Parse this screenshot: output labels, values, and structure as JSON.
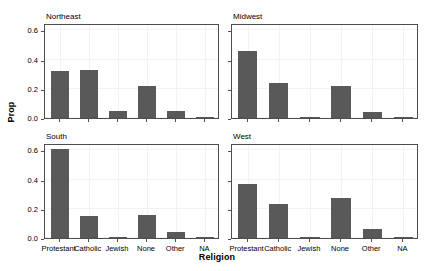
{
  "chart_data": {
    "type": "bar",
    "title": "",
    "xlabel": "Religion",
    "ylabel": "Prop",
    "ylim": [
      0,
      0.65
    ],
    "yticks": [
      0.0,
      0.2,
      0.4,
      0.6
    ],
    "ytick_labels": [
      "0.0",
      "0.2",
      "0.4",
      "0.6"
    ],
    "categories": [
      "Protestant",
      "Catholic",
      "Jewish",
      "None",
      "Other",
      "NA"
    ],
    "grid": true,
    "legend": "none",
    "facet_layout": "2x2",
    "bar_color": "#595959",
    "panel_border_color": "#4d4d4d",
    "gridline_color": "#f2f2f2",
    "background": "#ffffff",
    "series": [
      {
        "name": "Northeast",
        "values": [
          0.32,
          0.33,
          0.05,
          0.22,
          0.05,
          0.005
        ]
      },
      {
        "name": "Midwest",
        "values": [
          0.46,
          0.24,
          0.005,
          0.22,
          0.04,
          0.005
        ]
      },
      {
        "name": "South",
        "values": [
          0.61,
          0.15,
          0.005,
          0.16,
          0.04,
          0.005
        ]
      },
      {
        "name": "West",
        "values": [
          0.37,
          0.235,
          0.007,
          0.275,
          0.065,
          0.004
        ]
      }
    ]
  }
}
